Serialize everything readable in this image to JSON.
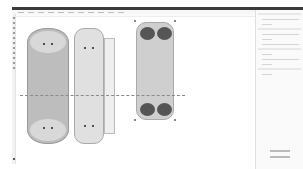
{
  "app": {
    "menu_items_count": 11
  },
  "canvas": {
    "artboards": [
      {
        "name": "donut-package",
        "fill": "#bdbdbd"
      },
      {
        "name": "milk-carton-package",
        "fill": "#e0e0e0"
      },
      {
        "name": "cherry-package",
        "fill": "#cfcfcf"
      }
    ],
    "fold_line_color": "#8a8a8a"
  },
  "panel": {
    "background": "#fafafa"
  }
}
